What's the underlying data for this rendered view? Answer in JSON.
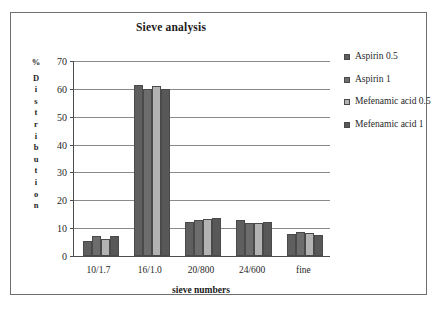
{
  "chart_data": {
    "type": "bar",
    "title": "Sieve analysis",
    "xlabel": "sieve numbers",
    "ylabel": "% Distribution",
    "ylim": [
      0,
      70
    ],
    "ytick_step": 10,
    "yticks": [
      70,
      60,
      50,
      40,
      30,
      20,
      10,
      0
    ],
    "grid": true,
    "legend_position": "right",
    "categories": [
      "10/1.7",
      "16/1.0",
      "20/800",
      "24/600",
      "fine"
    ],
    "series": [
      {
        "name": "Aspirin 0.5",
        "color": "#5f5f5f",
        "values": [
          5.5,
          61.5,
          12.3,
          13.0,
          8.0
        ]
      },
      {
        "name": "Aspirin 1",
        "color": "#6d6d6d",
        "values": [
          7.2,
          60.0,
          13.0,
          11.8,
          8.5
        ]
      },
      {
        "name": "Mefenamic acid 0.5",
        "color": "#b3b3b3",
        "values": [
          6.2,
          61.0,
          13.2,
          11.7,
          8.2
        ]
      },
      {
        "name": "Mefenamic acid 1",
        "color": "#585858",
        "values": [
          7.3,
          60.0,
          13.7,
          12.3,
          7.6
        ]
      }
    ]
  },
  "ylabel_chars": [
    "%",
    "",
    "D",
    "i",
    "s",
    "t",
    "r",
    "i",
    "b",
    "u",
    "t",
    "i",
    "o",
    "n"
  ]
}
